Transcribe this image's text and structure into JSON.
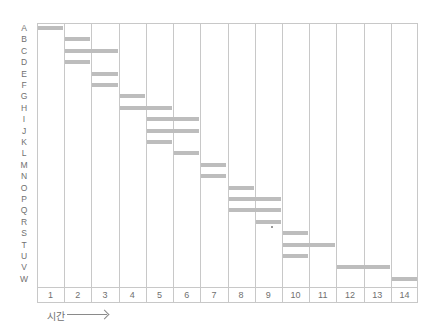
{
  "chart_data": {
    "type": "gantt",
    "title": "",
    "xlabel": "시간",
    "ylabel": "",
    "x_ticks": [
      "1",
      "2",
      "3",
      "4",
      "5",
      "6",
      "7",
      "8",
      "9",
      "10",
      "11",
      "12",
      "13",
      "14"
    ],
    "rows": [
      "A",
      "B",
      "C",
      "D",
      "E",
      "F",
      "G",
      "H",
      "I",
      "J",
      "K",
      "L",
      "M",
      "N",
      "O",
      "P",
      "Q",
      "R",
      "S",
      "T",
      "U",
      "V",
      "W"
    ],
    "tasks": [
      {
        "row": "A",
        "start": 1,
        "end": 1
      },
      {
        "row": "B",
        "start": 2,
        "end": 2
      },
      {
        "row": "C",
        "start": 2,
        "end": 3
      },
      {
        "row": "D",
        "start": 2,
        "end": 2
      },
      {
        "row": "E",
        "start": 3,
        "end": 3
      },
      {
        "row": "F",
        "start": 3,
        "end": 3
      },
      {
        "row": "G",
        "start": 4,
        "end": 4
      },
      {
        "row": "H",
        "start": 4,
        "end": 5
      },
      {
        "row": "I",
        "start": 5,
        "end": 6
      },
      {
        "row": "J",
        "start": 5,
        "end": 6
      },
      {
        "row": "K",
        "start": 5,
        "end": 5
      },
      {
        "row": "L",
        "start": 6,
        "end": 6
      },
      {
        "row": "M",
        "start": 7,
        "end": 7
      },
      {
        "row": "N",
        "start": 7,
        "end": 7
      },
      {
        "row": "O",
        "start": 8,
        "end": 8
      },
      {
        "row": "P",
        "start": 8,
        "end": 9
      },
      {
        "row": "Q",
        "start": 8,
        "end": 9
      },
      {
        "row": "R",
        "start": 9,
        "end": 9
      },
      {
        "row": "S",
        "start": 10,
        "end": 10
      },
      {
        "row": "T",
        "start": 10,
        "end": 11
      },
      {
        "row": "U",
        "start": 10,
        "end": 10
      },
      {
        "row": "V",
        "start": 12,
        "end": 13
      },
      {
        "row": "W",
        "start": 14,
        "end": 14
      }
    ],
    "grid": true,
    "colors": {
      "bar": "#bdbdbd",
      "grid": "#c8c8c8",
      "text": "#707070"
    }
  },
  "axis": {
    "time_label": "시간"
  }
}
